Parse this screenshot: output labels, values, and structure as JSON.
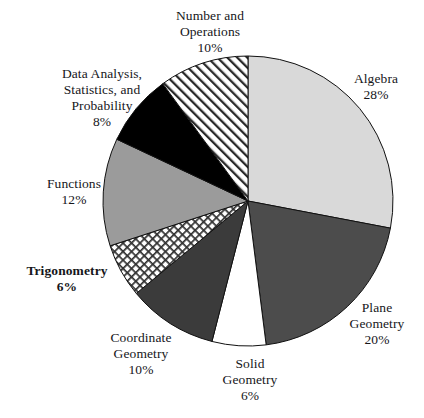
{
  "chart_data": {
    "type": "pie",
    "title": "",
    "subtitle": "",
    "xlabel": "",
    "ylabel": "",
    "legend_position": "none",
    "grid": false,
    "units": "percent",
    "total": 100,
    "start_angle_deg": 0,
    "direction": "clockwise",
    "categories": [
      "Algebra",
      "Plane Geometry",
      "Solid Geometry",
      "Coordinate Geometry",
      "Trigonometry",
      "Functions",
      "Data Analysis, Statistics, and Probability",
      "Number and Operations"
    ],
    "values": [
      28,
      20,
      6,
      10,
      6,
      12,
      8,
      10
    ],
    "slices": [
      {
        "name": "algebra",
        "label": "Algebra",
        "label_lines": [
          "Algebra"
        ],
        "percent_label": "28%",
        "value": 28,
        "fill": "#d9d9d9",
        "pattern": "solid",
        "emphasis": false
      },
      {
        "name": "plane-geometry",
        "label": "Plane Geometry",
        "label_lines": [
          "Plane",
          "Geometry"
        ],
        "percent_label": "20%",
        "value": 20,
        "fill": "#4c4c4c",
        "pattern": "solid",
        "emphasis": false
      },
      {
        "name": "solid-geometry",
        "label": "Solid Geometry",
        "label_lines": [
          "Solid",
          "Geometry"
        ],
        "percent_label": "6%",
        "value": 6,
        "fill": "#ffffff",
        "pattern": "solid",
        "emphasis": false
      },
      {
        "name": "coordinate-geometry",
        "label": "Coordinate Geometry",
        "label_lines": [
          "Coordinate",
          "Geometry"
        ],
        "percent_label": "10%",
        "value": 10,
        "fill": "#3b3b3b",
        "pattern": "solid",
        "emphasis": false
      },
      {
        "name": "trigonometry",
        "label": "Trigonometry",
        "label_lines": [
          "Trigonometry"
        ],
        "percent_label": "6%",
        "value": 6,
        "fill": "#ffffff",
        "pattern": "crosshatch",
        "emphasis": true
      },
      {
        "name": "functions",
        "label": "Functions",
        "label_lines": [
          "Functions"
        ],
        "percent_label": "12%",
        "value": 12,
        "fill": "#9b9b9b",
        "pattern": "solid",
        "emphasis": false
      },
      {
        "name": "data-analysis-statistics-and-probability",
        "label": "Data Analysis, Statistics, and Probability",
        "label_lines": [
          "Data Analysis,",
          "Statistics, and",
          "Probability"
        ],
        "percent_label": "8%",
        "value": 8,
        "fill": "#000000",
        "pattern": "solid",
        "emphasis": false
      },
      {
        "name": "number-and-operations",
        "label": "Number and Operations",
        "label_lines": [
          "Number and",
          "Operations"
        ],
        "percent_label": "10%",
        "value": 10,
        "fill": "#ffffff",
        "pattern": "diagonal-stripes",
        "emphasis": false
      }
    ]
  },
  "labels": {
    "algebra": {
      "line1": "Algebra",
      "pct": "28%"
    },
    "plane_geometry": {
      "line1": "Plane",
      "line2": "Geometry",
      "pct": "20%"
    },
    "solid_geometry": {
      "line1": "Solid",
      "line2": "Geometry",
      "pct": "6%"
    },
    "coordinate_geometry": {
      "line1": "Coordinate",
      "line2": "Geometry",
      "pct": "10%"
    },
    "trigonometry": {
      "line1": "Trigonometry",
      "pct": "6%"
    },
    "functions": {
      "line1": "Functions",
      "pct": "12%"
    },
    "data_analysis": {
      "line1": "Data Analysis,",
      "line2": "Statistics, and",
      "line3": "Probability",
      "pct": "8%"
    },
    "number_and_operations": {
      "line1": "Number and",
      "line2": "Operations",
      "pct": "10%"
    }
  },
  "geometry": {
    "center_x": 248,
    "center_y": 201,
    "radius": 145,
    "stroke": "#111111",
    "stroke_width": 1
  }
}
